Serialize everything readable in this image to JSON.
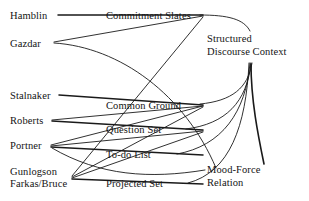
{
  "diagram": {
    "type": "node-link-diagram",
    "title": "",
    "background_color": "#ffffff",
    "text_color": "#141414",
    "edge_color": "#1a1a1a",
    "width": 309,
    "height": 201,
    "columns": {
      "authors": {
        "name": "authors",
        "position": "left",
        "nodes": [
          {
            "id": "hamblin",
            "label": "Hamblin",
            "x": 10,
            "y": 10
          },
          {
            "id": "gazdar",
            "label": "Gazdar",
            "x": 10,
            "y": 38
          },
          {
            "id": "stalnaker",
            "label": "Stalnaker",
            "x": 10,
            "y": 90
          },
          {
            "id": "roberts",
            "label": "Roberts",
            "x": 10,
            "y": 115
          },
          {
            "id": "portner",
            "label": "Portner",
            "x": 10,
            "y": 140
          },
          {
            "id": "gunlogson",
            "label": "Gunlogson",
            "x": 10,
            "y": 166
          },
          {
            "id": "farkas-bruce",
            "label": "Farkas/Bruce",
            "x": 10,
            "y": 178
          }
        ]
      },
      "components": {
        "name": "discourse-components",
        "position": "middle",
        "nodes": [
          {
            "id": "commitment-slates",
            "label": "Commitment Slates",
            "x": 106,
            "y": 10
          },
          {
            "id": "common-ground",
            "label": "Common Ground",
            "x": 106,
            "y": 100
          },
          {
            "id": "question-set",
            "label": "Question Set",
            "x": 106,
            "y": 124
          },
          {
            "id": "to-do-list",
            "label": "To-do List",
            "x": 106,
            "y": 149
          },
          {
            "id": "projected-set",
            "label": "Projected Set",
            "x": 106,
            "y": 178
          }
        ]
      },
      "results": {
        "name": "results",
        "position": "right",
        "nodes": [
          {
            "id": "structured-discourse-context",
            "label": "Structured\nDiscourse Context",
            "x": 207,
            "y": 33
          },
          {
            "id": "mood-force-relation",
            "label": "Mood-Force\nRelation",
            "x": 207,
            "y": 164
          }
        ]
      }
    },
    "edges": [
      {
        "from": "hamblin",
        "to": "commitment-slates",
        "style": "straight",
        "weight": "bold"
      },
      {
        "from": "gazdar",
        "to": "commitment-slates",
        "style": "straight",
        "weight": "normal"
      },
      {
        "from": "stalnaker",
        "to": "common-ground",
        "style": "straight",
        "weight": "bold"
      },
      {
        "from": "roberts",
        "to": "common-ground",
        "style": "straight",
        "weight": "normal"
      },
      {
        "from": "roberts",
        "to": "question-set",
        "style": "straight",
        "weight": "bold"
      },
      {
        "from": "portner",
        "to": "common-ground",
        "style": "straight",
        "weight": "normal"
      },
      {
        "from": "portner",
        "to": "question-set",
        "style": "straight",
        "weight": "normal"
      },
      {
        "from": "portner",
        "to": "to-do-list",
        "style": "straight",
        "weight": "bold"
      },
      {
        "from": "gunlogson",
        "to": "commitment-slates",
        "style": "straight",
        "weight": "normal"
      },
      {
        "from": "farkas-bruce",
        "to": "common-ground",
        "style": "straight",
        "weight": "normal"
      },
      {
        "from": "farkas-bruce",
        "to": "question-set",
        "style": "straight",
        "weight": "normal"
      },
      {
        "from": "farkas-bruce",
        "to": "projected-set",
        "style": "straight",
        "weight": "bold"
      },
      {
        "from": "commitment-slates",
        "to": "structured-discourse-context",
        "style": "curve",
        "weight": "normal"
      },
      {
        "from": "common-ground",
        "to": "structured-discourse-context",
        "style": "curve",
        "weight": "normal"
      },
      {
        "from": "question-set",
        "to": "structured-discourse-context",
        "style": "curve",
        "weight": "normal"
      },
      {
        "from": "to-do-list",
        "to": "structured-discourse-context",
        "style": "curve",
        "weight": "normal"
      },
      {
        "from": "projected-set",
        "to": "structured-discourse-context",
        "style": "curve",
        "weight": "normal"
      },
      {
        "from": "gazdar",
        "to": "mood-force-relation",
        "style": "curve",
        "weight": "normal"
      },
      {
        "from": "portner",
        "to": "mood-force-relation",
        "style": "curve",
        "weight": "normal"
      },
      {
        "from": "structured-discourse-context",
        "to": "mood-force-relation",
        "style": "curve",
        "weight": "bold"
      }
    ]
  }
}
